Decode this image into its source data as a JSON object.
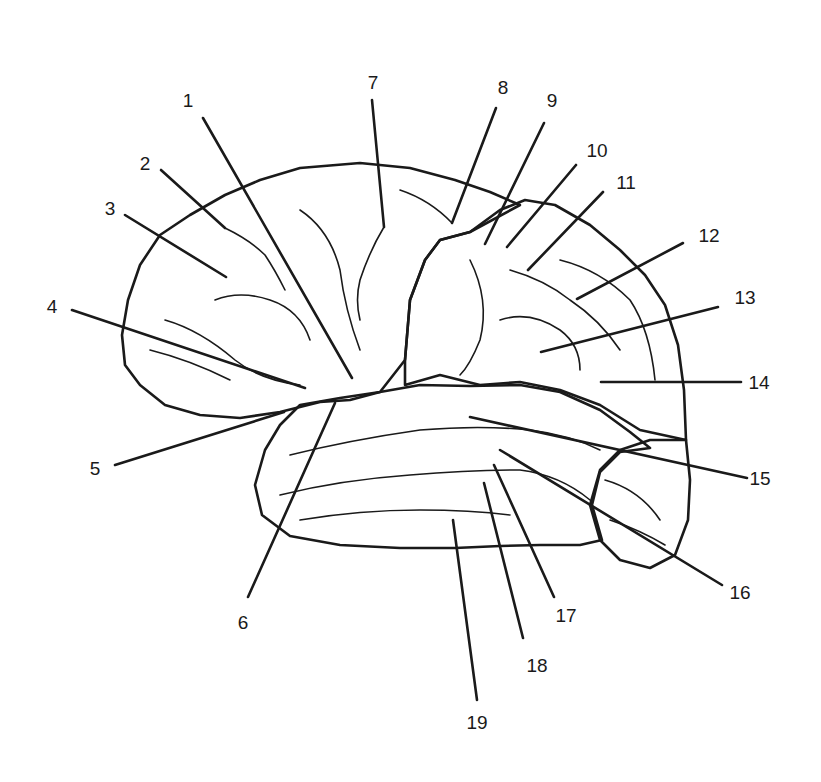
{
  "diagram": {
    "colors": {
      "ink": "#1a1a1a",
      "background": "#ffffff",
      "frontal_fill": "#ffffff",
      "parietal_fill": "stippled grid",
      "temporal_fill": "diagonal hatch",
      "occipital_fill": "random dots"
    },
    "regions": [
      {
        "name": "frontal-lobe",
        "pattern": "plain"
      },
      {
        "name": "parietal-lobe",
        "pattern": "crosshatch-dots"
      },
      {
        "name": "temporal-lobe",
        "pattern": "diagonal-hatch"
      },
      {
        "name": "occipital-lobe",
        "pattern": "random-dots"
      }
    ],
    "labels": [
      {
        "n": "1",
        "tx": 188,
        "ty": 107,
        "x1": 203,
        "y1": 118,
        "x2": 352,
        "y2": 378
      },
      {
        "n": "2",
        "tx": 145,
        "ty": 170,
        "x1": 161,
        "y1": 170,
        "x2": 225,
        "y2": 228
      },
      {
        "n": "3",
        "tx": 110,
        "ty": 215,
        "x1": 125,
        "y1": 215,
        "x2": 226,
        "y2": 277
      },
      {
        "n": "4",
        "tx": 52,
        "ty": 313,
        "x1": 72,
        "y1": 310,
        "x2": 305,
        "y2": 388
      },
      {
        "n": "5",
        "tx": 95,
        "ty": 475,
        "x1": 115,
        "y1": 465,
        "x2": 284,
        "y2": 412
      },
      {
        "n": "6",
        "tx": 243,
        "ty": 629,
        "x1": 248,
        "y1": 597,
        "x2": 335,
        "y2": 403
      },
      {
        "n": "7",
        "tx": 373,
        "ty": 89,
        "x1": 372,
        "y1": 100,
        "x2": 384,
        "y2": 227
      },
      {
        "n": "8",
        "tx": 503,
        "ty": 94,
        "x1": 496,
        "y1": 108,
        "x2": 452,
        "y2": 223
      },
      {
        "n": "9",
        "tx": 552,
        "ty": 107,
        "x1": 544,
        "y1": 123,
        "x2": 485,
        "y2": 244
      },
      {
        "n": "10",
        "tx": 597,
        "ty": 157,
        "x1": 576,
        "y1": 165,
        "x2": 507,
        "y2": 247
      },
      {
        "n": "11",
        "tx": 626,
        "ty": 189,
        "x1": 603,
        "y1": 192,
        "x2": 528,
        "y2": 270
      },
      {
        "n": "12",
        "tx": 709,
        "ty": 242,
        "x1": 683,
        "y1": 243,
        "x2": 577,
        "y2": 299
      },
      {
        "n": "13",
        "tx": 745,
        "ty": 304,
        "x1": 718,
        "y1": 307,
        "x2": 541,
        "y2": 352
      },
      {
        "n": "14",
        "tx": 759,
        "ty": 389,
        "x1": 741,
        "y1": 382,
        "x2": 601,
        "y2": 382
      },
      {
        "n": "15",
        "tx": 760,
        "ty": 485,
        "x1": 747,
        "y1": 478,
        "x2": 470,
        "y2": 417
      },
      {
        "n": "16",
        "tx": 740,
        "ty": 599,
        "x1": 722,
        "y1": 585,
        "x2": 500,
        "y2": 450
      },
      {
        "n": "17",
        "tx": 566,
        "ty": 622,
        "x1": 554,
        "y1": 597,
        "x2": 494,
        "y2": 465
      },
      {
        "n": "18",
        "tx": 537,
        "ty": 672,
        "x1": 523,
        "y1": 638,
        "x2": 484,
        "y2": 483
      },
      {
        "n": "19",
        "tx": 477,
        "ty": 729,
        "x1": 477,
        "y1": 700,
        "x2": 453,
        "y2": 520
      }
    ]
  }
}
